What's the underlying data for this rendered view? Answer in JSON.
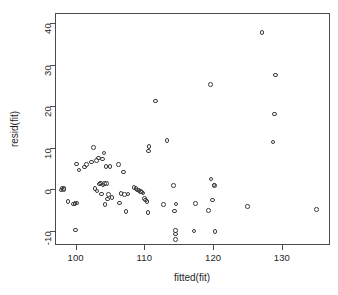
{
  "figure": {
    "background_color": "#ffffff",
    "frame_color": "#4a4a4a",
    "point_color": "#3c3c3c",
    "xlabel": "fitted(fit)",
    "ylabel": "resid(fit)"
  },
  "chart_data": {
    "type": "scatter",
    "title": "",
    "xlabel": "fitted(fit)",
    "ylabel": "resid(fit)",
    "xlim": [
      97.0,
      137.0
    ],
    "ylim": [
      -13.5,
      42.5
    ],
    "xticks": [
      100,
      110,
      120,
      130
    ],
    "yticks": [
      -10,
      0,
      10,
      20,
      30,
      40
    ],
    "xtick_labels": [
      "100",
      "110",
      "120",
      "130"
    ],
    "ytick_labels": [
      "-10",
      "0",
      "10",
      "20",
      "30",
      "40"
    ],
    "grid": false,
    "legend": null,
    "marker": "open-circle",
    "series": [
      {
        "name": "residuals",
        "x": [
          97.9,
          98.0,
          98.2,
          98.3,
          98.9,
          99.7,
          99.9,
          100.0,
          100.1,
          100.2,
          100.5,
          101.3,
          101.6,
          102.3,
          102.6,
          102.8,
          103.0,
          103.1,
          103.3,
          103.5,
          103.6,
          103.8,
          103.9,
          104.0,
          104.1,
          104.2,
          104.3,
          104.4,
          104.5,
          104.6,
          104.8,
          105.0,
          105.3,
          106.2,
          106.4,
          106.6,
          107.0,
          107.1,
          107.3,
          107.6,
          108.5,
          108.8,
          109.0,
          109.2,
          109.4,
          109.6,
          109.8,
          110.0,
          110.2,
          110.4,
          110.5,
          110.6,
          110.7,
          111.6,
          112.8,
          113.3,
          114.2,
          114.4,
          114.5,
          114.5,
          114.5,
          114.6,
          117.2,
          117.4,
          119.3,
          119.6,
          119.7,
          119.9,
          120.1,
          120.2,
          120.3,
          125.0,
          127.1,
          128.7,
          128.9,
          129.1,
          135.0
        ],
        "y": [
          -0.2,
          0.3,
          -0.1,
          0.2,
          -3.0,
          -3.6,
          -3.5,
          -9.9,
          6.1,
          -3.4,
          4.6,
          5.3,
          5.9,
          6.5,
          10.1,
          0.1,
          6.9,
          -0.5,
          7.5,
          1.2,
          1.5,
          -1.2,
          7.3,
          1.0,
          8.7,
          1.4,
          -3.7,
          5.4,
          1.3,
          -2.4,
          -1.3,
          5.5,
          -2.0,
          5.9,
          -3.4,
          -1.1,
          4.1,
          -1.3,
          -5.4,
          -1.2,
          0.4,
          0.1,
          -0.2,
          -0.3,
          -0.6,
          -0.7,
          -0.9,
          -2.3,
          -2.6,
          -3.0,
          -5.6,
          9.2,
          10.3,
          21.3,
          -3.7,
          11.7,
          0.8,
          -5.3,
          -10.0,
          -10.8,
          -12.2,
          -3.6,
          -10.1,
          -3.5,
          -5.2,
          25.3,
          2.4,
          -2.6,
          1.0,
          0.9,
          -10.3,
          -4.2,
          37.8,
          11.4,
          18.1,
          27.5,
          -5.0
        ]
      }
    ]
  }
}
